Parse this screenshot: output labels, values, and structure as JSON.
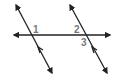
{
  "diagram": {
    "title": "",
    "line_color": "#222222",
    "label_color": "#777777",
    "transversal": {
      "x1": 14,
      "y1": 35,
      "x2": 110,
      "y2": 35
    },
    "parallel_lines": [
      {
        "x1": 16,
        "y1": 5,
        "x2": 52,
        "y2": 73
      },
      {
        "x1": 70,
        "y1": 5,
        "x2": 107,
        "y2": 73
      }
    ],
    "angle_labels": [
      {
        "text": "1",
        "x": 33,
        "y": 33
      },
      {
        "text": "2",
        "x": 74,
        "y": 33
      },
      {
        "text": "3",
        "x": 81,
        "y": 46
      }
    ]
  }
}
